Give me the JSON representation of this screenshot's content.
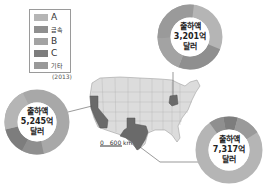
{
  "legend": {
    "items": [
      {
        "label": "A",
        "color": "#b5b5b5"
      },
      {
        "label": "금속",
        "color": "#8f8f8f"
      },
      {
        "label": "B",
        "color": "#a3a3a3"
      },
      {
        "label": "C",
        "color": "#7d7d7d"
      },
      {
        "label": "기타",
        "color": "#999999"
      }
    ],
    "year": "(2013)"
  },
  "donuts": {
    "top": {
      "line1": "출하액",
      "line2": "3,201억",
      "line3": "달러"
    },
    "left": {
      "line1": "출하액",
      "line2": "5,245억",
      "line3": "달러"
    },
    "right": {
      "line1": "출하액",
      "line2": "7,317억",
      "line3": "달러"
    }
  },
  "scale": {
    "zero": "0",
    "distance": "600 km"
  },
  "highlighted_states": [
    "California",
    "Texas",
    "Ohio"
  ]
}
